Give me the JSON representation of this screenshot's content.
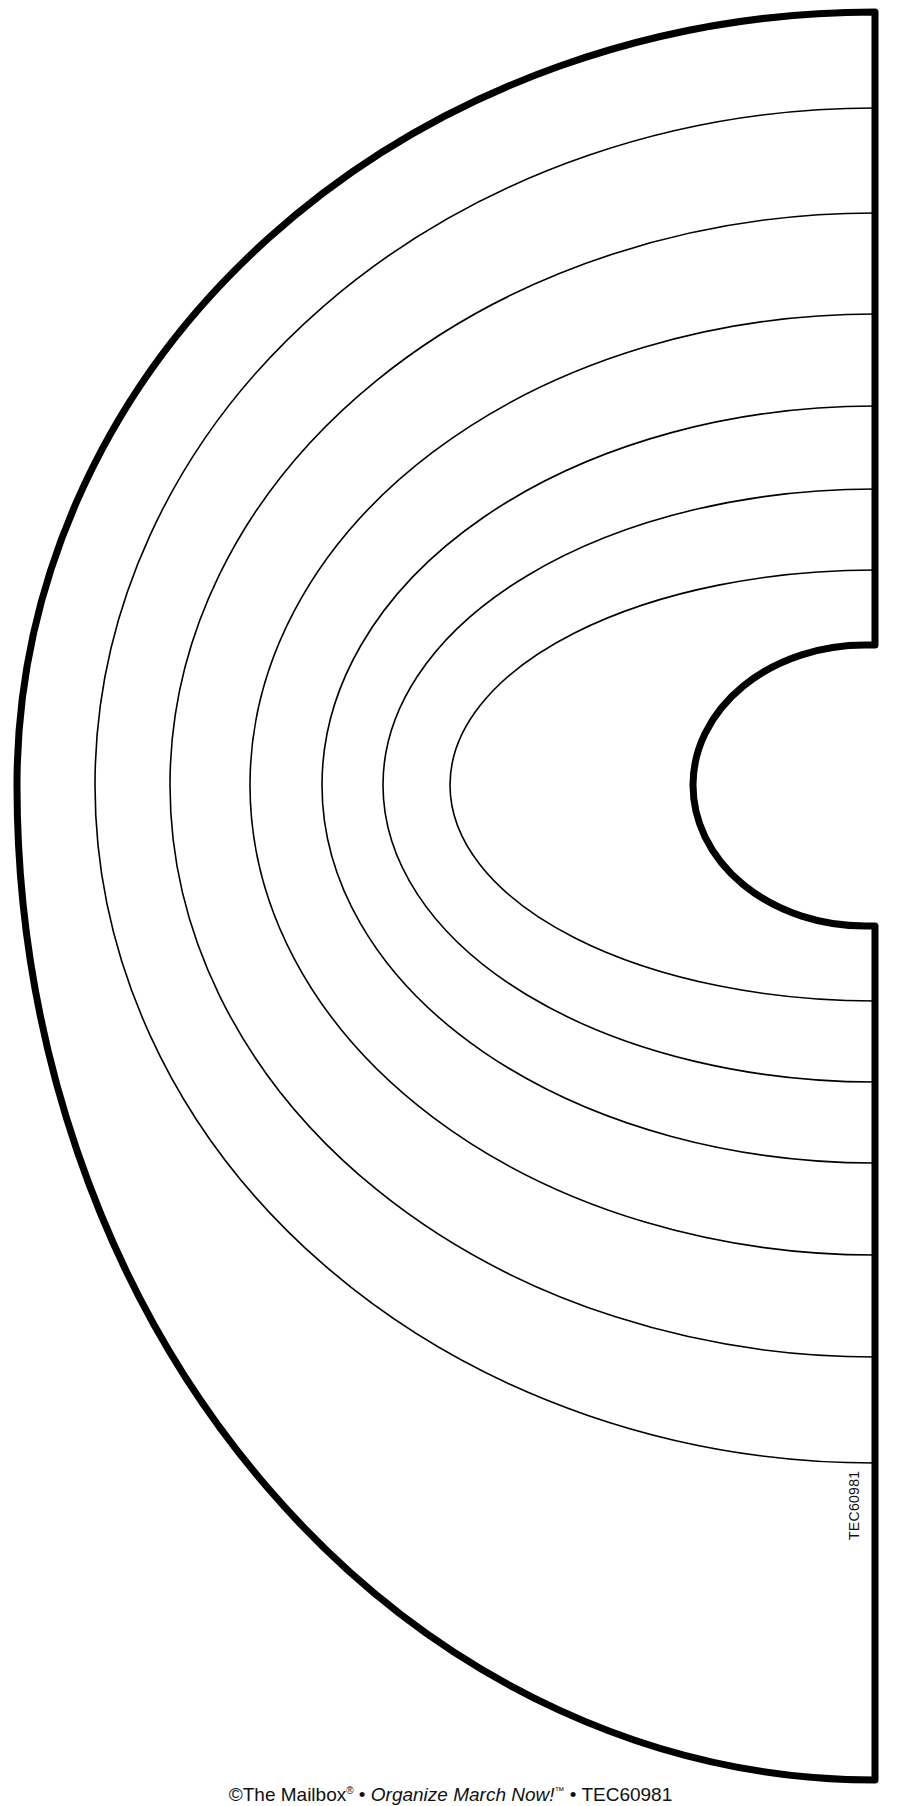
{
  "document": {
    "type": "rainbow-template",
    "product_code": "TEC60981",
    "footer": {
      "publisher": "©The Mailbox",
      "registered_mark": "®",
      "separator": " • ",
      "series_title": "Organize March Now!",
      "trademark": "™",
      "code": "TEC60981"
    }
  },
  "shape": {
    "center_x": 875,
    "center_y": 785,
    "stroke_color": "#000000",
    "fill_color": "#ffffff",
    "outer_stroke_width": 7,
    "inner_stroke_width": 1.6,
    "outer_boundary": {
      "rx": 858,
      "ry_top": 773,
      "ry_bottom": 995
    },
    "inner_cutout": {
      "rx": 182,
      "ry_top": 140,
      "ry_bottom": 141
    },
    "bands": [
      {
        "rx": 780,
        "ry_top": 677,
        "ry_bottom": 678
      },
      {
        "rx": 705,
        "ry_top": 572,
        "ry_bottom": 572
      },
      {
        "rx": 625,
        "ry_top": 471,
        "ry_bottom": 470
      },
      {
        "rx": 553,
        "ry_top": 379,
        "ry_bottom": 378
      },
      {
        "rx": 492,
        "ry_top": 296,
        "ry_bottom": 297
      },
      {
        "rx": 425,
        "ry_top": 215,
        "ry_bottom": 216
      }
    ],
    "right_edge_x": 875,
    "top_y": 12,
    "bottom_y": 1780
  }
}
